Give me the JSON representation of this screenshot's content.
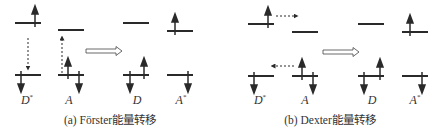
{
  "panels": [
    {
      "id": "a",
      "caption": "(a) Förster能量转移",
      "caption_x": 110,
      "labels": [
        {
          "base": "D",
          "sup": "*",
          "x": 27
        },
        {
          "base": "A",
          "sup": "",
          "x": 69
        },
        {
          "base": "D",
          "sup": "",
          "x": 137
        },
        {
          "base": "A",
          "sup": "*",
          "x": 181
        }
      ]
    },
    {
      "id": "b",
      "caption": "(b) Dexter能量转移",
      "caption_x": 330,
      "labels": [
        {
          "base": "D",
          "sup": "*",
          "x": 260
        },
        {
          "base": "A",
          "sup": "",
          "x": 305
        },
        {
          "base": "D",
          "sup": "",
          "x": 372
        },
        {
          "base": "A",
          "sup": "*",
          "x": 415
        }
      ]
    }
  ],
  "colors": {
    "line": "#2a2a2a",
    "text": "#333333"
  }
}
